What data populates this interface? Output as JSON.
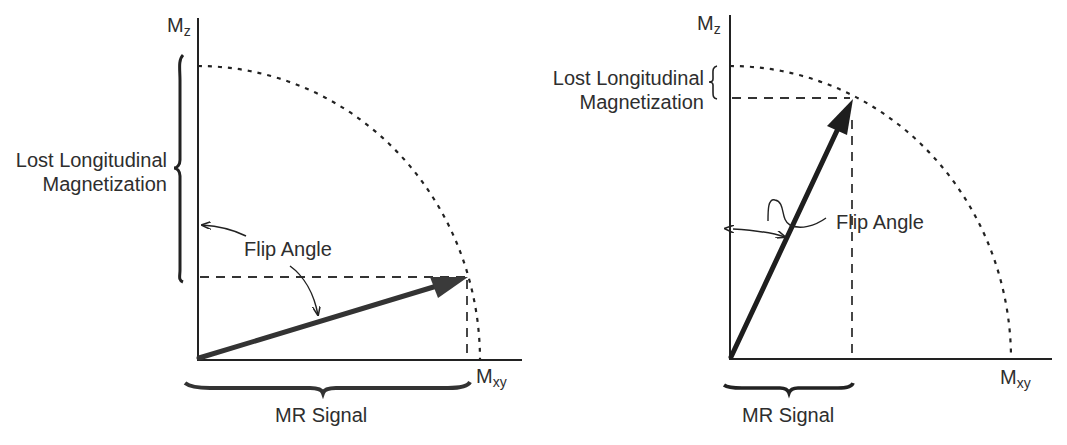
{
  "figure": {
    "panels": [
      {
        "id": "left",
        "description": "Large flip angle",
        "axis_vertical_label": "M",
        "axis_vertical_subscript": "z",
        "axis_horizontal_label": "M",
        "axis_horizontal_subscript": "xy",
        "lost_label_line1": "Lost Longitudinal",
        "lost_label_line2": "Magnetization",
        "flip_angle_label": "Flip Angle",
        "signal_label": "MR Signal"
      },
      {
        "id": "right",
        "description": "Small flip angle",
        "axis_vertical_label": "M",
        "axis_vertical_subscript": "z",
        "axis_horizontal_label": "M",
        "axis_horizontal_subscript": "xy",
        "lost_label_line1": "Lost Longitudinal",
        "lost_label_line2": "Magnetization",
        "flip_angle_label": "Flip Angle",
        "signal_label": "MR Signal"
      }
    ],
    "colors": {
      "ink": "#222222",
      "arrow": "#333333",
      "text": "#2e2e2e",
      "background": "#ffffff"
    }
  }
}
